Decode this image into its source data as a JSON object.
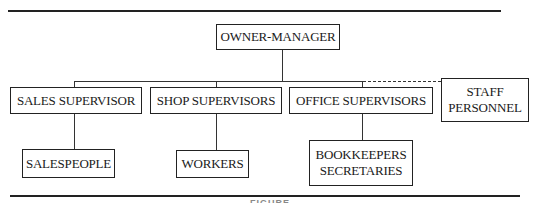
{
  "chart": {
    "root": {
      "label": "OWNER-MANAGER"
    },
    "level2": [
      {
        "label": "SALES SUPERVISOR"
      },
      {
        "label": "SHOP SUPERVISORS"
      },
      {
        "label": "OFFICE SUPERVISORS"
      }
    ],
    "staff": {
      "line1": "STAFF",
      "line2": "PERSONNEL"
    },
    "level3": [
      {
        "label": "SALESPEOPLE"
      },
      {
        "label": "WORKERS"
      },
      {
        "line1": "BOOKKEEPERS",
        "line2": "SECRETARIES"
      }
    ]
  },
  "caption": "FIGURE"
}
